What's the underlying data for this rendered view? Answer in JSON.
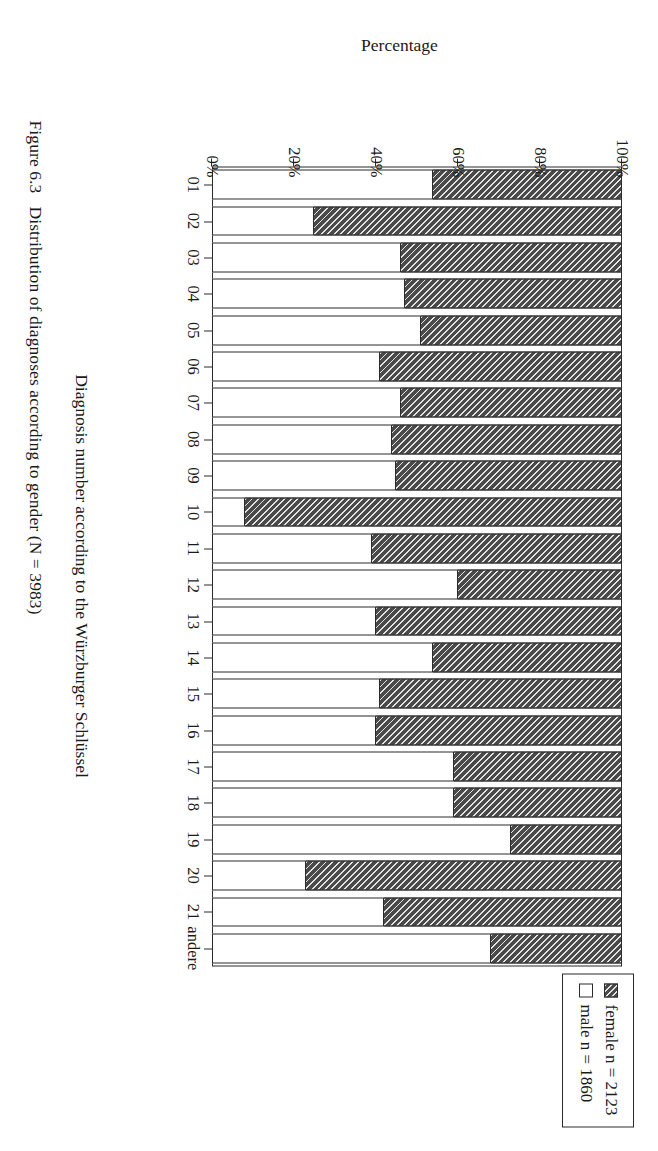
{
  "figure": {
    "caption_number": "Figure 6.3",
    "caption_text": "Distribution of diagnoses according to gender (N = 3983)"
  },
  "legend": {
    "position": "top-right",
    "items": [
      {
        "key": "female",
        "label": "female n = 2123",
        "swatch": "hatched-dark-diagonal",
        "color": "#4a4a4a"
      },
      {
        "key": "male",
        "label": "male n = 1860",
        "swatch": "white-outline",
        "color": "#ffffff"
      }
    ]
  },
  "chart_data": {
    "type": "bar",
    "title": "",
    "subtitle": "",
    "orientation": "vertical-stacked-100",
    "stacked": true,
    "grid": false,
    "xlabel": "Diagnosis number according to the Würzburger Schlüssel",
    "ylabel": "Percentage",
    "ylim": [
      0,
      100
    ],
    "yticks": [
      0,
      20,
      40,
      60,
      80,
      100
    ],
    "ytick_labels": [
      "0%",
      "20%",
      "40%",
      "60%",
      "80%",
      "100%"
    ],
    "categories": [
      "01",
      "02",
      "03",
      "04",
      "05",
      "06",
      "07",
      "08",
      "09",
      "10",
      "11",
      "12",
      "13",
      "14",
      "15",
      "16",
      "17",
      "18",
      "19",
      "20",
      "21",
      "andere"
    ],
    "series": [
      {
        "name": "female n = 2123",
        "color": "#4a4a4a",
        "values": [
          46,
          75,
          54,
          53,
          49,
          59,
          54,
          56,
          55,
          92,
          61,
          40,
          60,
          46,
          59,
          60,
          41,
          41,
          27,
          77,
          58,
          32
        ]
      },
      {
        "name": "male n = 1860",
        "color": "#ffffff",
        "values": [
          54,
          25,
          46,
          47,
          51,
          41,
          46,
          44,
          45,
          8,
          39,
          60,
          40,
          54,
          41,
          40,
          59,
          59,
          73,
          23,
          42,
          68
        ]
      }
    ],
    "totals": {
      "female": 2123,
      "male": 1860,
      "all": 3983
    }
  }
}
